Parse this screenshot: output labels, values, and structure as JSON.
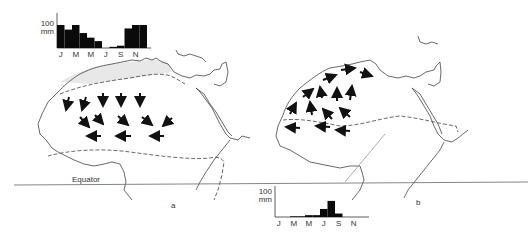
{
  "figure": {
    "equator_label": "Equator",
    "panel_a_label": "a",
    "panel_b_label": "b"
  },
  "chart_data": [
    {
      "type": "bar",
      "title": "Monthly rainfall (panel a, northern station)",
      "ylabel_value": "100",
      "ylabel_unit": "mm",
      "tick_labels": [
        "J",
        "M",
        "M",
        "J",
        "S",
        "N"
      ],
      "categories": [
        "J",
        "F",
        "M",
        "A",
        "M",
        "J",
        "J",
        "A",
        "S",
        "O",
        "N",
        "D"
      ],
      "values": [
        100,
        80,
        100,
        65,
        45,
        30,
        0,
        5,
        10,
        85,
        100,
        100
      ],
      "ylim": [
        0,
        120
      ],
      "grid": false
    },
    {
      "type": "bar",
      "title": "Monthly rainfall (panel b, southern station)",
      "ylabel_value": "100",
      "ylabel_unit": "mm",
      "tick_labels": [
        "J",
        "M",
        "M",
        "J",
        "S",
        "N"
      ],
      "categories": [
        "J",
        "F",
        "M",
        "A",
        "M",
        "J",
        "J",
        "A",
        "S",
        "O",
        "N",
        "D"
      ],
      "values": [
        0,
        0,
        3,
        3,
        8,
        8,
        35,
        70,
        15,
        0,
        0,
        0
      ],
      "ylim": [
        0,
        120
      ],
      "grid": false
    }
  ],
  "maps": {
    "a": {
      "description": "Winter: northerly/north-easterly winds over Sahara",
      "arrows": 13
    },
    "b": {
      "description": "Summer: southerly/south-westerly monsoon winds",
      "arrows": 13
    }
  }
}
